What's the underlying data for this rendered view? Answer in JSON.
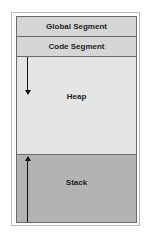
{
  "diagram": {
    "segments": [
      {
        "id": "global",
        "label": "Global Segment",
        "color": "#d6d6d6"
      },
      {
        "id": "code",
        "label": "Code Segment",
        "color": "#d6d6d6"
      },
      {
        "id": "heap",
        "label": "Heap",
        "color": "#e4e4e4",
        "growth": "down"
      },
      {
        "id": "stack",
        "label": "Stack",
        "color": "#b3b3b3",
        "growth": "up"
      }
    ]
  }
}
